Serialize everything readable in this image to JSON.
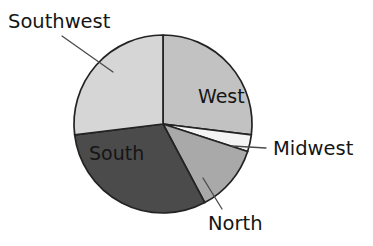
{
  "chart_data": {
    "type": "pie",
    "title": "",
    "subtitle": "",
    "xlabel": "",
    "ylabel": "",
    "legend_position": "none",
    "grid": false,
    "label_style": "slice labels with leader lines",
    "start_angle_deg": 0,
    "direction": "clockwise",
    "categories": [
      "West",
      "Midwest",
      "North",
      "South",
      "Southwest"
    ],
    "values": [
      27,
      3,
      12,
      31,
      27
    ],
    "units": "percent",
    "slices": [
      {
        "label": "West",
        "value": 27,
        "start_angle_deg": 0,
        "end_angle_deg": 97,
        "color": "#c2c2c2",
        "label_placement": "inside",
        "label_x": 198,
        "label_y": 103,
        "text_color": "#151515"
      },
      {
        "label": "Midwest",
        "value": 3,
        "start_angle_deg": 97,
        "end_angle_deg": 108,
        "color": "#f4f4f4",
        "label_placement": "outside",
        "label_x": 273,
        "label_y": 155,
        "text_color": "#151515",
        "leader_from_x": 232,
        "leader_from_y": 146,
        "leader_to_x": 266,
        "leader_to_y": 148
      },
      {
        "label": "North",
        "value": 12,
        "start_angle_deg": 108,
        "end_angle_deg": 152,
        "color": "#a9a9a9",
        "label_placement": "outside",
        "label_x": 208,
        "label_y": 230,
        "text_color": "#151515",
        "leader_from_x": 203,
        "leader_from_y": 178,
        "leader_to_x": 222,
        "leader_to_y": 209
      },
      {
        "label": "South",
        "value": 31,
        "start_angle_deg": 152,
        "end_angle_deg": 263,
        "color": "#4b4b4b",
        "label_placement": "inside",
        "label_x": 89,
        "label_y": 160,
        "text_color": "#0d0d0d"
      },
      {
        "label": "Southwest",
        "value": 27,
        "start_angle_deg": 263,
        "end_angle_deg": 360,
        "color": "#d6d6d6",
        "label_placement": "outside",
        "label_x": 8,
        "label_y": 28,
        "text_color": "#151515",
        "leader_from_x": 113,
        "leader_from_y": 72,
        "leader_to_x": 62,
        "leader_to_y": 36
      }
    ],
    "geometry": {
      "center_x": 163,
      "center_y": 124,
      "radius": 89
    },
    "outline_color": "#232323",
    "background_color": "#ffffff"
  }
}
